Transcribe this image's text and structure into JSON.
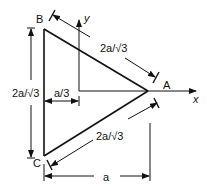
{
  "diagram": {
    "type": "equilateral-triangle-dimensioned",
    "vertices": {
      "A": {
        "label": "A"
      },
      "B": {
        "label": "B"
      },
      "C": {
        "label": "C"
      }
    },
    "axes": {
      "x_label": "x",
      "y_label": "y"
    },
    "dimensions": {
      "side_BA": "2a/√3",
      "side_CA": "2a/√3",
      "side_BC": "2a/√3",
      "centroid_offset": "a/3",
      "height": "a"
    },
    "colors": {
      "line": "#111111",
      "background": "#ffffff"
    }
  }
}
